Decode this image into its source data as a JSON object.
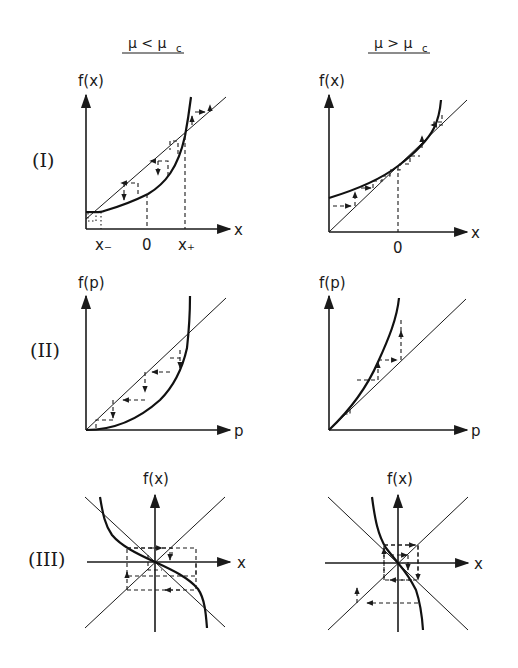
{
  "figure": {
    "columns": [
      {
        "title": "μ < μ",
        "title_sub": "c",
        "condition": "mu less than mu_c"
      },
      {
        "title": "μ > μ",
        "title_sub": "c",
        "condition": "mu greater than mu_c"
      }
    ],
    "rows": [
      {
        "label": "(I)",
        "y_label": "f(x)",
        "x_label": "x"
      },
      {
        "label": "(II)",
        "y_label": "f(p)",
        "x_label": "p"
      },
      {
        "label": "(III)",
        "y_label": "f(x)",
        "x_label": "x"
      }
    ],
    "panels": {
      "I_left": {
        "ticks": [
          "x₋",
          "0",
          "x₊"
        ],
        "description": "convex curve crossing diagonal at x- (stable) and x+ (unstable); cobweb arrows converge to x-"
      },
      "I_right": {
        "ticks": [
          "0"
        ],
        "description": "curve lies entirely above diagonal; cobweb steps move rightward through bottleneck near 0"
      },
      "II_left": {
        "description": "convex map with fixed points at origin and upper intersection; cobweb descends to origin"
      },
      "II_right": {
        "description": "curve above diagonal; cobweb moves away from origin"
      },
      "III_left": {
        "description": "decreasing odd map through origin with diagonals y=x and y=-x; cobweb spirals into origin"
      },
      "III_right": {
        "description": "steep decreasing map; cobweb spirals outward from origin"
      }
    }
  }
}
